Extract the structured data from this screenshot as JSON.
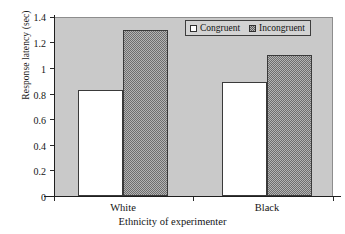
{
  "chart_data": {
    "type": "bar",
    "title": "",
    "xlabel": "Ethnicity of experimenter",
    "ylabel": "Response latency (sec)",
    "categories": [
      "White",
      "Black"
    ],
    "series": [
      {
        "name": "Congruent",
        "values": [
          0.83,
          0.89
        ]
      },
      {
        "name": "Incongruent",
        "values": [
          1.3,
          1.1
        ]
      }
    ],
    "ylim": [
      0,
      1.4
    ],
    "yticks": [
      0,
      0.2,
      0.4,
      0.6,
      0.8,
      1,
      1.2,
      1.4
    ],
    "ytick_labels": [
      "0",
      "0.2",
      "0.4",
      "0.6",
      "0.8",
      "1",
      "1.2",
      "1.4"
    ],
    "grid": false,
    "legend_position": "top-right",
    "colors": {
      "plot_background": "#c9c9c9",
      "congruent_fill": "#ffffff",
      "incongruent_fill": "#b4b4b4",
      "axis": "#1f1f1f",
      "text": "#141414"
    }
  },
  "legend": {
    "entries": [
      {
        "label": "Congruent",
        "swatch": "empty-square-swatch"
      },
      {
        "label": "Incongruent",
        "swatch": "hatched-square-swatch"
      }
    ]
  },
  "axes": {
    "y_title": "Response latency (sec)",
    "x_title": "Ethnicity of experimenter",
    "y_labels": {
      "t0": "0",
      "t1": "0.2",
      "t2": "0.4",
      "t3": "0.6",
      "t4": "0.8",
      "t5": "1",
      "t6": "1.2",
      "t7": "1.4"
    },
    "x_labels": {
      "c0": "White",
      "c1": "Black"
    }
  }
}
